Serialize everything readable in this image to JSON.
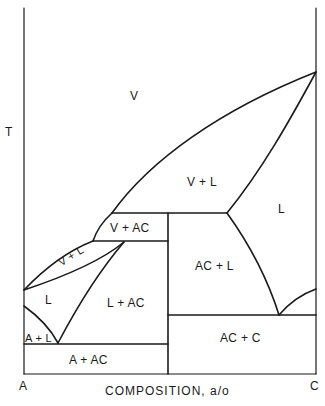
{
  "diagram": {
    "type": "binary phase diagram",
    "y_axis_label": "T",
    "x_axis_label": "COMPOSITION, a/o",
    "x_left_endpoint": "A",
    "x_right_endpoint": "C",
    "line_color": "#1a1a1a",
    "regions": {
      "v": "V",
      "v_plus_l_upper": "V + L",
      "l_right": "L",
      "v_plus_ac": "V + AC",
      "v_plus_l_lower": "V + L",
      "l_left": "L",
      "l_plus_ac": "L + AC",
      "ac_plus_l": "AC + L",
      "a_plus_l": "A + L",
      "a_plus_ac": "A + AC",
      "ac_plus_c": "AC + C"
    }
  }
}
